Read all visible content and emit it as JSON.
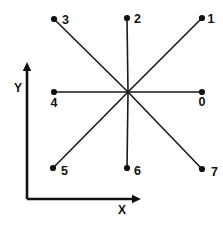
{
  "figure": {
    "background_color": "#ffffff",
    "ink_color": "#111111",
    "width": 223,
    "height": 227,
    "center": {
      "x": 128,
      "y": 92
    },
    "dot_radius": 3.1
  },
  "axes": {
    "origin": {
      "x": 27,
      "y": 199
    },
    "x_axis": {
      "label": "X",
      "label_pos": {
        "x": 122,
        "y": 214
      },
      "start": {
        "x": 27,
        "y": 199
      },
      "end": {
        "x": 141,
        "y": 199
      },
      "arrow": "right"
    },
    "y_axis": {
      "label": "Y",
      "label_pos": {
        "x": 18,
        "y": 92
      },
      "start": {
        "x": 27,
        "y": 199
      },
      "end": {
        "x": 27,
        "y": 62
      },
      "arrow": "up"
    }
  },
  "chart_data": {
    "type": "scatter",
    "title": "",
    "subtitle": "",
    "xlabel": "X",
    "ylabel": "Y",
    "grid": false,
    "legend": null,
    "center": {
      "x": 128,
      "y": 92
    },
    "points": [
      {
        "label": "0",
        "direction": "east",
        "angle_deg": 0,
        "x": 202,
        "y": 92,
        "label_x": 202,
        "label_y": 106,
        "label_anchor": "middle"
      },
      {
        "label": "1",
        "direction": "north-east",
        "angle_deg": 45,
        "x": 202,
        "y": 18,
        "label_x": 211,
        "label_y": 23,
        "label_anchor": "middle"
      },
      {
        "label": "2",
        "direction": "north",
        "angle_deg": 90,
        "x": 127,
        "y": 18,
        "label_x": 134,
        "label_y": 23,
        "label_anchor": "start"
      },
      {
        "label": "3",
        "direction": "north-west",
        "angle_deg": 135,
        "x": 54,
        "y": 19,
        "label_x": 62,
        "label_y": 24,
        "label_anchor": "start"
      },
      {
        "label": "4",
        "direction": "west",
        "angle_deg": 180,
        "x": 54,
        "y": 92,
        "label_x": 54,
        "label_y": 107,
        "label_anchor": "middle"
      },
      {
        "label": "5",
        "direction": "south-west",
        "angle_deg": 225,
        "x": 53,
        "y": 168,
        "label_x": 61,
        "label_y": 175,
        "label_anchor": "start"
      },
      {
        "label": "6",
        "direction": "south",
        "angle_deg": 270,
        "x": 127,
        "y": 168,
        "label_x": 134,
        "label_y": 175,
        "label_anchor": "start"
      },
      {
        "label": "7",
        "direction": "south-east",
        "angle_deg": 315,
        "x": 202,
        "y": 169,
        "label_x": 211,
        "label_y": 176,
        "label_anchor": "start"
      }
    ]
  }
}
